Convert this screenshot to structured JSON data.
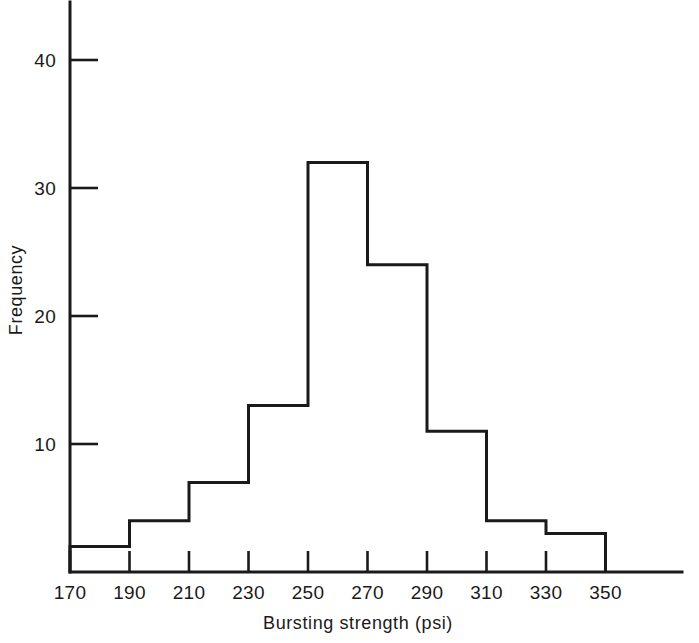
{
  "chart_data": {
    "type": "bar",
    "title": "",
    "subtitle": "",
    "xlabel": "Bursting strength  (psi)",
    "ylabel": "Frequency",
    "categories": [
      "170-190",
      "190-210",
      "210-230",
      "230-250",
      "250-270",
      "270-290",
      "290-310",
      "310-330",
      "330-350"
    ],
    "bin_edges": [
      170,
      190,
      210,
      230,
      250,
      270,
      290,
      310,
      330,
      350
    ],
    "values": [
      2,
      4,
      7,
      13,
      32,
      24,
      11,
      4,
      3
    ],
    "bin_width": 20,
    "xlim": [
      170,
      350
    ],
    "ylim": [
      0,
      44
    ],
    "xticks": [
      170,
      190,
      210,
      230,
      250,
      270,
      290,
      310,
      330,
      350
    ],
    "xtick_labels": [
      "170",
      "190",
      "210",
      "230",
      "250",
      "270",
      "290",
      "310",
      "330",
      "350"
    ],
    "yticks": [
      10,
      20,
      30,
      40
    ],
    "ytick_labels": [
      "10",
      "20",
      "30",
      "40"
    ],
    "grid": false,
    "legend": null,
    "bar_fill": "#ffffff",
    "bar_stroke": "#1a1a1a",
    "axis_color": "#1a1a1a",
    "background": "#ffffff",
    "total_frequency": 100
  }
}
